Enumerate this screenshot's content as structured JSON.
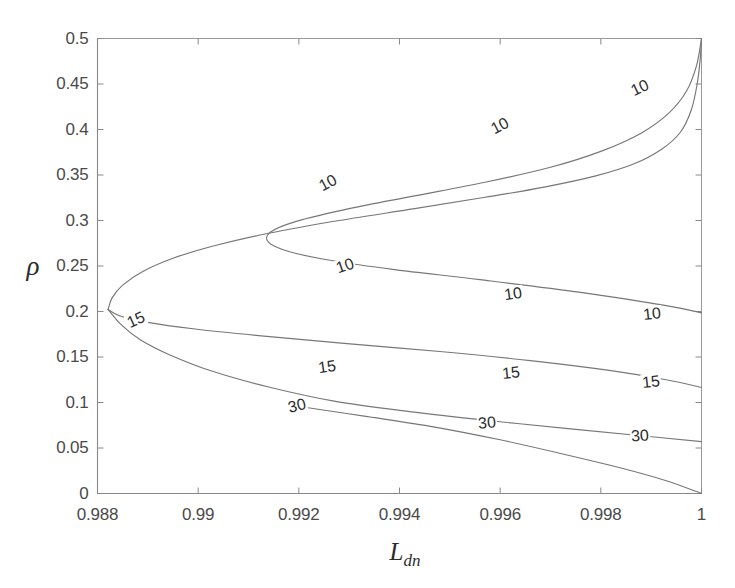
{
  "chart_data": {
    "type": "line",
    "subtype": "contour",
    "title": "",
    "xlabel": "L_dn",
    "xlabel_base": "L",
    "xlabel_sub": "dn",
    "ylabel": "ρ",
    "xlim": [
      0.988,
      1.0
    ],
    "ylim": [
      0.0,
      0.5
    ],
    "xticks": [
      0.988,
      0.99,
      0.992,
      0.994,
      0.996,
      0.998,
      1
    ],
    "xtick_labels": [
      "0.988",
      "0.99",
      "0.992",
      "0.994",
      "0.996",
      "0.998",
      "1"
    ],
    "yticks": [
      0,
      0.05,
      0.1,
      0.15,
      0.2,
      0.25,
      0.3,
      0.35,
      0.4,
      0.45,
      0.5
    ],
    "ytick_labels": [
      "0",
      "0.05",
      "0.1",
      "0.15",
      "0.2",
      "0.25",
      "0.3",
      "0.35",
      "0.4",
      "0.45",
      "0.5"
    ],
    "grid": false,
    "legend": "none",
    "line_color": "#777777",
    "axis_color": "#888888",
    "levels": [
      10,
      15,
      30
    ],
    "contours": [
      {
        "level": 10,
        "level_label": "10",
        "name": "outer-10-upper",
        "points": [
          [
            0.98821,
            0.2022
          ],
          [
            0.98829,
            0.215
          ],
          [
            0.9885,
            0.229
          ],
          [
            0.9889,
            0.244
          ],
          [
            0.9895,
            0.2585
          ],
          [
            0.9903,
            0.272
          ],
          [
            0.9914,
            0.286
          ],
          [
            0.9928,
            0.3
          ],
          [
            0.9943,
            0.313
          ],
          [
            0.9957,
            0.3255
          ],
          [
            0.9969,
            0.337
          ],
          [
            0.9979,
            0.349
          ],
          [
            0.99865,
            0.362
          ],
          [
            0.9992,
            0.378
          ],
          [
            0.99958,
            0.397
          ],
          [
            0.9998,
            0.422
          ],
          [
            0.99992,
            0.452
          ],
          [
            0.99998,
            0.481
          ],
          [
            1.0,
            0.5
          ]
        ]
      },
      {
        "level": 10,
        "level_label": "10",
        "name": "inner-10",
        "points": [
          [
            1.0,
            0.5
          ],
          [
            0.9999,
            0.47
          ],
          [
            0.9997,
            0.442
          ],
          [
            0.99935,
            0.418
          ],
          [
            0.9988,
            0.396
          ],
          [
            0.998,
            0.376
          ],
          [
            0.997,
            0.3585
          ],
          [
            0.9957,
            0.342
          ],
          [
            0.9943,
            0.327
          ],
          [
            0.993,
            0.313
          ],
          [
            0.99195,
            0.299
          ],
          [
            0.99143,
            0.287
          ],
          [
            0.9914,
            0.276
          ],
          [
            0.9918,
            0.266
          ],
          [
            0.99265,
            0.256
          ],
          [
            0.9939,
            0.246
          ],
          [
            0.9956,
            0.235
          ],
          [
            0.9976,
            0.221
          ],
          [
            0.9993,
            0.2065
          ],
          [
            1.0,
            0.1985
          ]
        ]
      },
      {
        "level": 15,
        "level_label": "15",
        "name": "15-contour",
        "points": [
          [
            0.98821,
            0.2022
          ],
          [
            0.98845,
            0.195
          ],
          [
            0.989,
            0.188
          ],
          [
            0.9899,
            0.181
          ],
          [
            0.9912,
            0.1735
          ],
          [
            0.9929,
            0.165
          ],
          [
            0.9948,
            0.156
          ],
          [
            0.9966,
            0.146
          ],
          [
            0.9982,
            0.135
          ],
          [
            0.9993,
            0.125
          ],
          [
            1.0,
            0.1165
          ]
        ]
      },
      {
        "level": 30,
        "level_label": "30",
        "name": "30-upper",
        "points": [
          [
            0.98821,
            0.2022
          ],
          [
            0.98848,
            0.185
          ],
          [
            0.98885,
            0.169
          ],
          [
            0.98945,
            0.152
          ],
          [
            0.9903,
            0.134
          ],
          [
            0.9914,
            0.117
          ],
          [
            0.9927,
            0.1015
          ],
          [
            0.9942,
            0.09
          ],
          [
            0.9958,
            0.08
          ],
          [
            0.9974,
            0.071
          ],
          [
            0.9988,
            0.0635
          ],
          [
            1.0,
            0.057
          ]
        ]
      },
      {
        "level": 30,
        "level_label": "30",
        "name": "30-lower",
        "points": [
          [
            0.99215,
            0.0945
          ],
          [
            0.9933,
            0.085
          ],
          [
            0.9947,
            0.073
          ],
          [
            0.996,
            0.059
          ],
          [
            0.9972,
            0.044
          ],
          [
            0.9984,
            0.028
          ],
          [
            0.9993,
            0.014
          ],
          [
            1.0,
            0.0
          ]
        ]
      }
    ],
    "inline_labels": [
      {
        "text": "10",
        "x": 0.99257,
        "y": 0.3413,
        "rotate": -28,
        "name": "contour-label-10-a"
      },
      {
        "text": "10",
        "x": 0.99599,
        "y": 0.4038,
        "rotate": -28,
        "name": "contour-label-10-b"
      },
      {
        "text": "10",
        "x": 0.99877,
        "y": 0.4459,
        "rotate": -25,
        "name": "contour-label-10-c"
      },
      {
        "text": "10",
        "x": 0.99291,
        "y": 0.2495,
        "rotate": -19,
        "name": "contour-label-10-d"
      },
      {
        "text": "10",
        "x": 0.99626,
        "y": 0.2188,
        "rotate": -8,
        "name": "contour-label-10-e"
      },
      {
        "text": "10",
        "x": 0.99901,
        "y": 0.1977,
        "rotate": -6,
        "name": "contour-label-10-f"
      },
      {
        "text": "15",
        "x": 0.98877,
        "y": 0.1905,
        "rotate": -24,
        "name": "contour-label-15-a"
      },
      {
        "text": "15",
        "x": 0.99255,
        "y": 0.1392,
        "rotate": -8,
        "name": "contour-label-15-b"
      },
      {
        "text": "15",
        "x": 0.99622,
        "y": 0.132,
        "rotate": -6,
        "name": "contour-label-15-c"
      },
      {
        "text": "15",
        "x": 0.999,
        "y": 0.123,
        "rotate": -6,
        "name": "contour-label-15-d"
      },
      {
        "text": "30",
        "x": 0.99197,
        "y": 0.0962,
        "rotate": -14,
        "name": "contour-label-30-a"
      },
      {
        "text": "30",
        "x": 0.99573,
        "y": 0.077,
        "rotate": -5,
        "name": "contour-label-30-b"
      },
      {
        "text": "30",
        "x": 0.99878,
        "y": 0.0637,
        "rotate": -4,
        "name": "contour-label-30-c"
      }
    ]
  }
}
